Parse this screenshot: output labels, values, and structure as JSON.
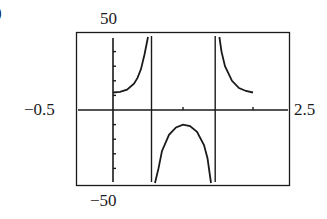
{
  "part_label": ")",
  "window": {
    "xmin_label": "−0.5",
    "xmax_label": "2.5",
    "ymax_label": "50",
    "ymin_label": "−50"
  },
  "chart_data": {
    "type": "line",
    "title": "",
    "xlabel": "",
    "ylabel": "",
    "xlim": [
      -0.5,
      2.5
    ],
    "ylim": [
      -50,
      50
    ],
    "grid": false,
    "x_ticks": [
      1,
      2
    ],
    "y_tick_spacing": 10,
    "vertical_asymptotes": [
      0.55,
      1.46
    ],
    "series": [
      {
        "name": "branch-left",
        "x": [
          0.0,
          0.1,
          0.2,
          0.3,
          0.35,
          0.4,
          0.45,
          0.5
        ],
        "y": [
          12,
          12.5,
          14,
          18,
          22,
          28,
          38,
          50
        ]
      },
      {
        "name": "branch-middle",
        "x": [
          0.6,
          0.65,
          0.7,
          0.8,
          0.9,
          1.0,
          1.1,
          1.2,
          1.3,
          1.35,
          1.4
        ],
        "y": [
          -50,
          -40,
          -28,
          -17,
          -12,
          -10,
          -11,
          -15,
          -24,
          -33,
          -50
        ]
      },
      {
        "name": "branch-right",
        "x": [
          1.52,
          1.55,
          1.6,
          1.7,
          1.8,
          1.9,
          2.0
        ],
        "y": [
          50,
          40,
          30,
          20,
          15,
          13,
          12
        ]
      }
    ]
  },
  "colors": {
    "ink": "#1a1a1a",
    "background": "#ffffff"
  }
}
